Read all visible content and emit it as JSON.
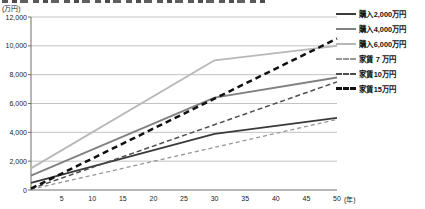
{
  "chart_data": {
    "type": "line",
    "y_unit_label": "(万円)",
    "x_unit_label": "(年)",
    "xlim": [
      0,
      50
    ],
    "ylim": [
      0,
      12000
    ],
    "grid": true,
    "legend_position": "right",
    "x_ticks": [
      5,
      10,
      15,
      20,
      25,
      30,
      35,
      40,
      45,
      50
    ],
    "y_ticks": [
      0,
      2000,
      4000,
      6000,
      8000,
      10000,
      12000
    ],
    "y_tick_labels": [
      "0",
      "2,000",
      "4,000",
      "6,000",
      "8,000",
      "10,000",
      "12,000"
    ],
    "series": [
      {
        "name": "購入2,000万円",
        "style": "solid",
        "color": "#3a3a3a",
        "width": 1.8,
        "points": [
          [
            0,
            500
          ],
          [
            30,
            3900
          ],
          [
            50,
            5000
          ]
        ]
      },
      {
        "name": "購入4,000万円",
        "style": "solid",
        "color": "#808080",
        "width": 1.8,
        "points": [
          [
            0,
            1000
          ],
          [
            30,
            6400
          ],
          [
            50,
            7800
          ]
        ]
      },
      {
        "name": "購入6,000万円",
        "style": "solid",
        "color": "#b8b8b8",
        "width": 1.8,
        "points": [
          [
            0,
            1500
          ],
          [
            30,
            9000
          ],
          [
            50,
            10000
          ]
        ]
      },
      {
        "name": "家賃 7 万円",
        "style": "dashed",
        "color": "#979797",
        "width": 1.3,
        "dash": "4 3",
        "points": [
          [
            0,
            50
          ],
          [
            50,
            4900
          ]
        ]
      },
      {
        "name": "家賃10万円",
        "style": "dashed",
        "color": "#4f4f4f",
        "width": 1.5,
        "dash": "5 3",
        "points": [
          [
            0,
            80
          ],
          [
            50,
            7500
          ]
        ]
      },
      {
        "name": "家賃15万円",
        "style": "dashed",
        "color": "#111111",
        "width": 2.5,
        "dash": "6 4",
        "points": [
          [
            0,
            100
          ],
          [
            50,
            10500
          ]
        ]
      }
    ]
  }
}
